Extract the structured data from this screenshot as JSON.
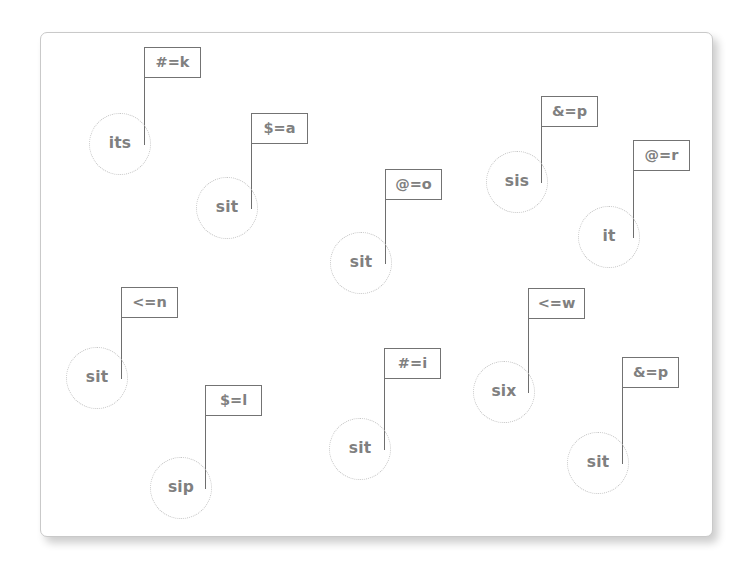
{
  "canvas": {
    "width": 755,
    "height": 566,
    "background_color": "#ffffff"
  },
  "card": {
    "x": 40,
    "y": 32,
    "width": 673,
    "height": 505,
    "background_color": "#ffffff",
    "border_color": "#c9c9c9",
    "corner_radius": 7,
    "shadow": true
  },
  "style": {
    "node_text_color": "#808080",
    "node_border_color": "#c2c2c2",
    "flag_border_color": "#737373",
    "flag_text_color": "#808080",
    "pole_color": "#6e6e6e",
    "node_diameter": 62,
    "flag_width": 57,
    "flag_height": 31
  },
  "markers": [
    {
      "id": "marker-1",
      "node_label": "its",
      "flag_label": "#=k",
      "node_x": 89,
      "node_y": 113,
      "pole_x": 144,
      "pole_top": 47,
      "pole_bottom": 145,
      "flag_x": 144,
      "flag_y": 47
    },
    {
      "id": "marker-2",
      "node_label": "sit",
      "flag_label": "$=a",
      "node_x": 196,
      "node_y": 177,
      "pole_x": 251,
      "pole_top": 113,
      "pole_bottom": 209,
      "flag_x": 251,
      "flag_y": 113
    },
    {
      "id": "marker-3",
      "node_label": "sit",
      "flag_label": "@=o",
      "node_x": 330,
      "node_y": 232,
      "pole_x": 385,
      "pole_top": 169,
      "pole_bottom": 264,
      "flag_x": 385,
      "flag_y": 169
    },
    {
      "id": "marker-4",
      "node_label": "sis",
      "flag_label": "&=p",
      "node_x": 486,
      "node_y": 151,
      "pole_x": 541,
      "pole_top": 96,
      "pole_bottom": 183,
      "flag_x": 541,
      "flag_y": 96
    },
    {
      "id": "marker-5",
      "node_label": "it",
      "flag_label": "@=r",
      "node_x": 578,
      "node_y": 206,
      "pole_x": 633,
      "pole_top": 140,
      "pole_bottom": 238,
      "flag_x": 633,
      "flag_y": 140
    },
    {
      "id": "marker-6",
      "node_label": "sit",
      "flag_label": "<=n",
      "node_x": 66,
      "node_y": 347,
      "pole_x": 121,
      "pole_top": 287,
      "pole_bottom": 379,
      "flag_x": 121,
      "flag_y": 287
    },
    {
      "id": "marker-7",
      "node_label": "sip",
      "flag_label": "$=l",
      "node_x": 150,
      "node_y": 457,
      "pole_x": 205,
      "pole_top": 385,
      "pole_bottom": 489,
      "flag_x": 205,
      "flag_y": 385
    },
    {
      "id": "marker-8",
      "node_label": "sit",
      "flag_label": "#=i",
      "node_x": 329,
      "node_y": 418,
      "pole_x": 384,
      "pole_top": 348,
      "pole_bottom": 450,
      "flag_x": 384,
      "flag_y": 348
    },
    {
      "id": "marker-9",
      "node_label": "six",
      "flag_label": "<=w",
      "node_x": 473,
      "node_y": 361,
      "pole_x": 528,
      "pole_top": 288,
      "pole_bottom": 393,
      "flag_x": 528,
      "flag_y": 288
    },
    {
      "id": "marker-10",
      "node_label": "sit",
      "flag_label": "&=p",
      "node_x": 567,
      "node_y": 432,
      "pole_x": 622,
      "pole_top": 357,
      "pole_bottom": 464,
      "flag_x": 622,
      "flag_y": 357
    }
  ]
}
